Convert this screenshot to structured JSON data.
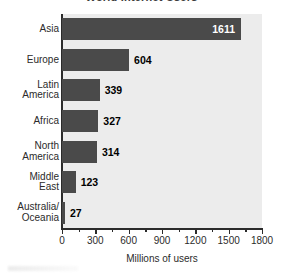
{
  "chart_data": {
    "type": "bar",
    "orientation": "horizontal",
    "title": "World Internet Users",
    "xlabel": "Millions of users",
    "ylabel": "",
    "categories": [
      "Asia",
      "Europe",
      "Latin America",
      "Africa",
      "North America",
      "Middle East",
      "Australia/ Oceania"
    ],
    "category_lines": [
      [
        "Asia"
      ],
      [
        "Europe"
      ],
      [
        "Latin",
        "America"
      ],
      [
        "Africa"
      ],
      [
        "North",
        "America"
      ],
      [
        "Middle",
        "East"
      ],
      [
        "Australia/",
        "Oceania"
      ]
    ],
    "values": [
      1611,
      604,
      339,
      327,
      314,
      123,
      27
    ],
    "value_labels": [
      "1611",
      "604",
      "339",
      "327",
      "314",
      "123",
      "27"
    ],
    "xlim": [
      0,
      1800
    ],
    "xticks": [
      0,
      300,
      600,
      900,
      1200,
      1500,
      1800
    ],
    "xtick_labels": [
      "0",
      "300",
      "600",
      "900",
      "1200",
      "1500",
      "1800"
    ],
    "minor_xticks": [
      150,
      450,
      750,
      1050,
      1350,
      1650
    ],
    "grid": false,
    "legend": "none",
    "bar_color": "#4a4a4a",
    "plot_background": "#ececec",
    "figure_background": "#ffffff",
    "axis_color": "#2b2b2b",
    "label_color_inside": "#ffffff",
    "label_color_outside": "#000000"
  }
}
